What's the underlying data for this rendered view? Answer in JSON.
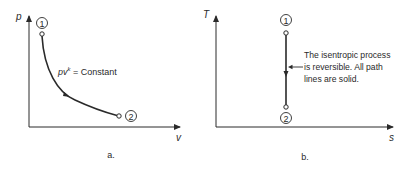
{
  "diagram_a": {
    "y_axis_label": "p",
    "x_axis_label": "v",
    "state_1_label": "1",
    "state_2_label": "2",
    "equation_base": "pv",
    "equation_exponent": "k",
    "equation_rest": " = Constant",
    "caption": "a."
  },
  "diagram_b": {
    "y_axis_label": "T",
    "x_axis_label": "s",
    "state_1_label": "1",
    "state_2_label": "2",
    "annotation_lines": [
      "The isentropic process",
      "is reversible. All path",
      "lines are solid."
    ],
    "caption": "b."
  },
  "colors": {
    "ink": "#2a2a2a",
    "background": "#ffffff"
  }
}
